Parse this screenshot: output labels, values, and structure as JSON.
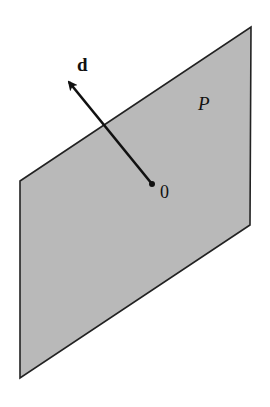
{
  "diagram": {
    "plane": {
      "label": "P",
      "fill": "#b9b9b9",
      "stroke": "#222222",
      "corners": {
        "top_left": [
          20,
          181
        ],
        "top_right": [
          251,
          27
        ],
        "bottom_right": [
          250,
          225
        ],
        "bottom_left": [
          20,
          378
        ]
      }
    },
    "vector": {
      "label": "d",
      "origin_label": "0",
      "color": "#111111",
      "from": [
        152,
        184
      ],
      "to": [
        67,
        80
      ]
    }
  }
}
